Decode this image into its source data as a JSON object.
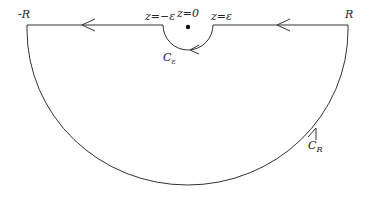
{
  "diagram": {
    "type": "contour",
    "labels": {
      "neg_R": "-R",
      "pos_R": "R",
      "z_neg_eps": "z=−ε",
      "z_zero": "z=0",
      "z_pos_eps": "z=ε",
      "c_eps_main": "C",
      "c_eps_sub": "ε",
      "c_R_main": "C",
      "c_R_sub": "R"
    },
    "colors": {
      "stroke": "#333333",
      "text": "#222222",
      "background": "#ffffff"
    }
  }
}
